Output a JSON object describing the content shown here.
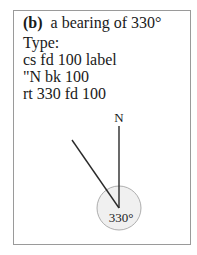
{
  "panel": {
    "label": "(b)",
    "title": "a bearing of 330°"
  },
  "instructions": {
    "lines": [
      "Type:",
      "cs fd 100 label",
      "\"N bk 100",
      "rt 330 fd 100"
    ]
  },
  "diagram": {
    "north_label": "N",
    "angle_label": "330°",
    "bearing_degrees": 330,
    "colors": {
      "line": "#2a2a2a",
      "circle_fill": "#f0f0f0",
      "circle_stroke": "#9a9a9a",
      "border": "#9a9a9a"
    }
  }
}
